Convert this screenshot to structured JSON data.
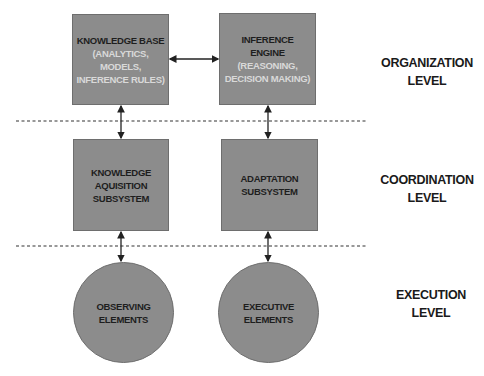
{
  "diagram": {
    "nodes": {
      "knowledge_base": {
        "title": "KNOWLEDGE BASE",
        "sub1": "(ANALYTICS,",
        "sub2": "MODELS,",
        "sub3": "INFERENCE RULES)"
      },
      "inference_engine": {
        "title1": "INFERENCE",
        "title2": "ENGINE",
        "sub1": "(REASONING,",
        "sub2": "DECISION MAKING)"
      },
      "knowledge_acquisition": {
        "line1": "KNOWLEDGE",
        "line2": "AQUISITION",
        "line3": "SUBSYSTEM"
      },
      "adaptation": {
        "line1": "ADAPTATION",
        "line2": "SUBSYSTEM"
      },
      "observing": {
        "line1": "OBSERVING",
        "line2": "ELEMENTS"
      },
      "executive": {
        "line1": "EXECUTIVE",
        "line2": "ELEMENTS"
      }
    },
    "levels": {
      "organization": {
        "line1": "ORGANIZATION",
        "line2": "LEVEL"
      },
      "coordination": {
        "line1": "COORDINATION",
        "line2": "LEVEL"
      },
      "execution": {
        "line1": "EXECUTION",
        "line2": "LEVEL"
      }
    },
    "colors": {
      "node_fill": "#8c8c8c",
      "node_border": "#6e6e6e",
      "dark_text": "#1e1e1e",
      "light_text": "#d9d9d9",
      "line": "#222222"
    },
    "edges": [
      {
        "from": "knowledge_base",
        "to": "inference_engine",
        "type": "bidirectional"
      },
      {
        "from": "knowledge_base",
        "to": "knowledge_acquisition",
        "type": "bidirectional"
      },
      {
        "from": "inference_engine",
        "to": "adaptation",
        "type": "unidirectional"
      },
      {
        "from": "knowledge_acquisition",
        "to": "observing",
        "type": "bidirectional"
      },
      {
        "from": "adaptation",
        "to": "executive",
        "type": "bidirectional"
      }
    ]
  }
}
